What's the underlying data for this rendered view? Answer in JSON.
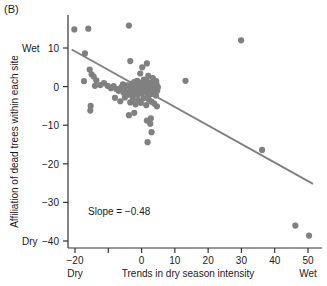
{
  "panel": {
    "label": "(B)"
  },
  "chart_data": {
    "type": "scatter",
    "title": "",
    "panel_label": "(B)",
    "xlabel": "Trends in dry season intensity",
    "ylabel": "Affiliation of dead trees within each site",
    "xlim": [
      -23,
      54
    ],
    "ylim": [
      -42,
      18
    ],
    "grid": false,
    "legend": null,
    "xticks": [
      -20,
      -10,
      0,
      10,
      20,
      30,
      40,
      50
    ],
    "xtick_labels": [
      "−20",
      "",
      "0",
      "10",
      "20",
      "30",
      "40",
      "50"
    ],
    "yticks": [
      10,
      0,
      -10,
      -20,
      -30,
      -40
    ],
    "ytick_labels": [
      "10",
      "0",
      "−10",
      "−20",
      "−30",
      "−40"
    ],
    "x_axis_extremes": {
      "low": "Dry",
      "high": "Wet"
    },
    "y_axis_extremes": {
      "low": "Dry",
      "high": "Wet"
    },
    "annotations": [
      {
        "text": "Slope = −0.48",
        "x": 0,
        "y": -31
      }
    ],
    "point_color": "#808080",
    "line_color": "#808080",
    "axis_color": "#333333",
    "marker_size": 4.2,
    "trendline": {
      "slope": -0.48,
      "type": "linear",
      "x_start": -21.0,
      "y_start": 9.6,
      "x_end": 51.5,
      "y_end": -25.2
    },
    "points": [
      [
        -20.2,
        14.8
      ],
      [
        -17.0,
        8.6
      ],
      [
        -16.0,
        15.0
      ],
      [
        -17.3,
        1.4
      ],
      [
        -15.6,
        4.4
      ],
      [
        -15.0,
        3.2
      ],
      [
        -14.4,
        2.6
      ],
      [
        -14.0,
        0.2
      ],
      [
        -13.6,
        1.6
      ],
      [
        -15.3,
        -5.0
      ],
      [
        -15.4,
        -6.2
      ],
      [
        -12.4,
        0.4
      ],
      [
        -11.3,
        0.9
      ],
      [
        -10.2,
        0.2
      ],
      [
        -9.2,
        -0.4
      ],
      [
        -8.4,
        0.1
      ],
      [
        -7.6,
        -0.6
      ],
      [
        -6.9,
        -1.1
      ],
      [
        -6.1,
        -0.2
      ],
      [
        -5.4,
        -1.6
      ],
      [
        -5.0,
        -2.8
      ],
      [
        -4.6,
        -0.8
      ],
      [
        -4.3,
        0.3
      ],
      [
        -4.0,
        -2.1
      ],
      [
        -3.8,
        15.8
      ],
      [
        -3.4,
        6.6
      ],
      [
        -3.6,
        -0.3
      ],
      [
        -3.2,
        -1.4
      ],
      [
        -3.0,
        0.8
      ],
      [
        -2.7,
        -2.4
      ],
      [
        -2.5,
        0.4
      ],
      [
        -2.3,
        -0.9
      ],
      [
        -2.1,
        1.2
      ],
      [
        -1.9,
        -1.8
      ],
      [
        -1.7,
        0.2
      ],
      [
        -1.5,
        -0.6
      ],
      [
        -1.3,
        1.5
      ],
      [
        -1.1,
        -2.2
      ],
      [
        -0.9,
        0.6
      ],
      [
        -0.7,
        -1.2
      ],
      [
        -0.5,
        0.1
      ],
      [
        -0.3,
        -0.4
      ],
      [
        -0.1,
        1.0
      ],
      [
        0.1,
        -1.6
      ],
      [
        0.3,
        0.4
      ],
      [
        0.5,
        -0.8
      ],
      [
        0.7,
        1.8
      ],
      [
        0.9,
        -0.2
      ],
      [
        1.1,
        -1.4
      ],
      [
        1.3,
        0.7
      ],
      [
        1.5,
        -0.5
      ],
      [
        1.7,
        1.3
      ],
      [
        1.9,
        -2.0
      ],
      [
        2.1,
        0.2
      ],
      [
        2.3,
        -1.0
      ],
      [
        2.5,
        0.9
      ],
      [
        2.7,
        -0.3
      ],
      [
        2.9,
        -1.9
      ],
      [
        3.1,
        0.5
      ],
      [
        3.3,
        -0.7
      ],
      [
        3.5,
        1.1
      ],
      [
        3.7,
        -1.3
      ],
      [
        3.9,
        0.3
      ],
      [
        4.1,
        -0.5
      ],
      [
        4.3,
        -2.3
      ],
      [
        4.5,
        0.6
      ],
      [
        4.7,
        -1.1
      ],
      [
        4.9,
        -0.2
      ],
      [
        -3.4,
        -4.1
      ],
      [
        -2.6,
        -3.2
      ],
      [
        -1.8,
        -4.6
      ],
      [
        -1.0,
        -3.6
      ],
      [
        -0.2,
        -4.2
      ],
      [
        0.6,
        -3.0
      ],
      [
        1.4,
        -4.8
      ],
      [
        2.2,
        -3.4
      ],
      [
        3.0,
        -3.9
      ],
      [
        3.8,
        -4.4
      ],
      [
        4.6,
        -5.1
      ],
      [
        -3.8,
        -7.4
      ],
      [
        -2.2,
        -6.8
      ],
      [
        1.6,
        -8.8
      ],
      [
        2.6,
        -9.6
      ],
      [
        2.8,
        -8.2
      ],
      [
        3.0,
        -11.8
      ],
      [
        1.8,
        -14.4
      ],
      [
        1.6,
        6.0
      ],
      [
        0.2,
        5.0
      ],
      [
        -0.4,
        3.4
      ],
      [
        2.0,
        2.8
      ],
      [
        3.4,
        2.2
      ],
      [
        4.4,
        1.4
      ],
      [
        -5.6,
        0.6
      ],
      [
        -8.0,
        -2.9
      ],
      [
        -6.4,
        -3.8
      ],
      [
        13.2,
        1.5
      ],
      [
        29.9,
        12.0
      ],
      [
        36.2,
        -16.4
      ],
      [
        46.2,
        -36.0
      ],
      [
        50.3,
        -38.6
      ]
    ]
  }
}
